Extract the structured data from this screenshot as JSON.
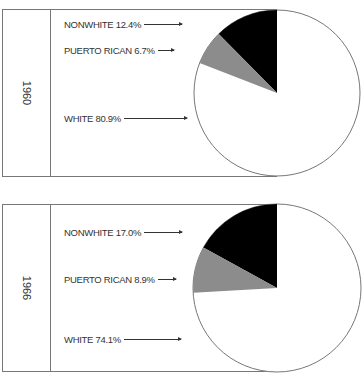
{
  "panels": [
    {
      "year": "1960",
      "labels": [
        {
          "text": "NONWHITE 12.4%"
        },
        {
          "text": "PUERTO RICAN 6.7%"
        },
        {
          "text": "WHITE 80.9%"
        }
      ]
    },
    {
      "year": "1966",
      "labels": [
        {
          "text": "NONWHITE 17.0%"
        },
        {
          "text": "PUERTO RICAN 8.9%"
        },
        {
          "text": "WHITE 74.1%"
        }
      ]
    }
  ],
  "chart_data": [
    {
      "type": "pie",
      "title": "1960",
      "categories": [
        "Nonwhite",
        "Puerto Rican",
        "White"
      ],
      "values": [
        12.4,
        6.7,
        80.9
      ],
      "colors": [
        "#000000",
        "#8c8c8c",
        "#ffffff"
      ],
      "start_angle": "12 o'clock, counterclockwise for nonwhite then puerto rican"
    },
    {
      "type": "pie",
      "title": "1966",
      "categories": [
        "Nonwhite",
        "Puerto Rican",
        "White"
      ],
      "values": [
        17.0,
        8.9,
        74.1
      ],
      "colors": [
        "#000000",
        "#8c8c8c",
        "#ffffff"
      ],
      "start_angle": "12 o'clock, counterclockwise for nonwhite then puerto rican"
    }
  ]
}
